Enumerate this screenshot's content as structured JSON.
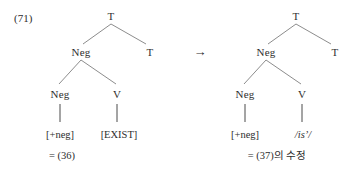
{
  "figure": {
    "example_number": "(71)",
    "transform_arrow": "→",
    "trees": [
      {
        "id": "left-tree",
        "caption": "=  (36)",
        "nodes": {
          "root": "T",
          "left_child": "Neg",
          "right_child": "T",
          "grandchild_left": "Neg",
          "grandchild_right": "V"
        },
        "leaves": {
          "neg_leaf": "[+neg]",
          "v_leaf": "[EXIST]"
        }
      },
      {
        "id": "right-tree",
        "caption": "=  (37)의  수정",
        "nodes": {
          "root": "T",
          "left_child": "Neg",
          "right_child": "T",
          "grandchild_left": "Neg",
          "grandchild_right": "V"
        },
        "leaves": {
          "neg_leaf": "[+neg]",
          "v_leaf": "/isʼ/"
        }
      }
    ]
  },
  "colors": {
    "background": "#ffffff",
    "text": "#2e2e2e",
    "branch_line": "#6f6f6f",
    "stem_line": "#4a4a4a"
  }
}
